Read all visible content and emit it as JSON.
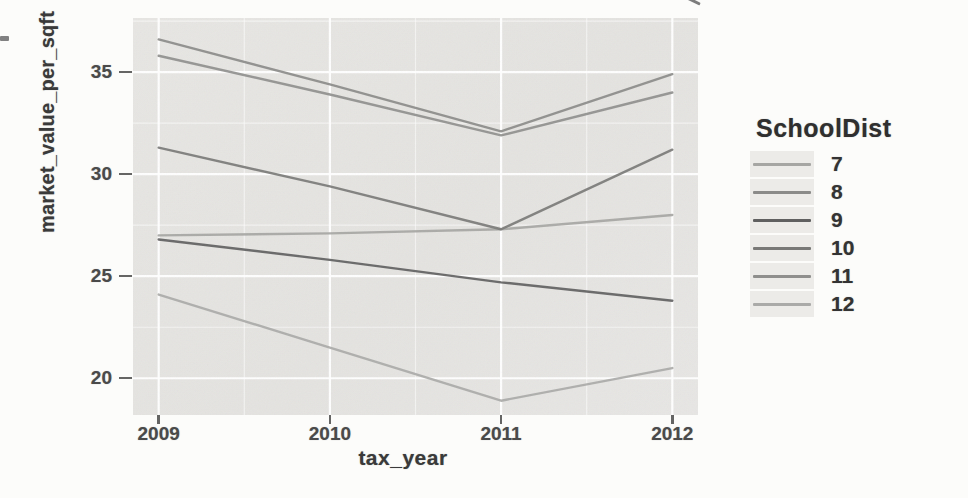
{
  "figure": {
    "y_axis_title": "market_value_per_sqft",
    "x_axis_title": "tax_year",
    "y_tick_labels": [
      "35",
      "30",
      "25",
      "20"
    ],
    "x_tick_labels": [
      "2009",
      "2010",
      "2011",
      "2012"
    ]
  },
  "legend": {
    "title": "SchoolDist",
    "entries": [
      {
        "label": "7"
      },
      {
        "label": "8"
      },
      {
        "label": "9"
      },
      {
        "label": "10"
      },
      {
        "label": "11"
      },
      {
        "label": "12"
      }
    ]
  },
  "chart_data": {
    "type": "line",
    "title": "",
    "xlabel": "tax_year",
    "ylabel": "market_value_per_sqft",
    "x": [
      2009,
      2010,
      2011,
      2012
    ],
    "series": [
      {
        "name": "7",
        "values": [
          27.0,
          27.1,
          27.3,
          28.0
        ],
        "color": "#a6a6a3"
      },
      {
        "name": "8",
        "values": [
          36.6,
          34.4,
          32.1,
          34.9
        ],
        "color": "#8b8b89"
      },
      {
        "name": "9",
        "values": [
          26.8,
          25.8,
          24.7,
          23.8
        ],
        "color": "#606060"
      },
      {
        "name": "10",
        "values": [
          31.3,
          29.4,
          27.3,
          31.2
        ],
        "color": "#797977"
      },
      {
        "name": "11",
        "values": [
          35.8,
          33.9,
          31.9,
          34.0
        ],
        "color": "#8f8f8d"
      },
      {
        "name": "12",
        "values": [
          24.1,
          21.5,
          18.9,
          20.5
        ],
        "color": "#aaaaa8"
      }
    ],
    "xlim": [
      2008.85,
      2012.15
    ],
    "ylim": [
      18.2,
      37.65
    ],
    "x_major_ticks": [
      2009,
      2010,
      2011,
      2012
    ],
    "x_minor_gridlines": [
      2009.5,
      2010.5,
      2011.5
    ],
    "y_major_ticks": [
      35,
      30,
      25,
      20
    ],
    "y_minor_gridlines": [
      37.5,
      32.5,
      27.5,
      22.5
    ],
    "grid": "white major and minor gridlines on gray panel",
    "legend_position": "right",
    "panel_bg": "#e5e4e1",
    "grid_color": "#ffffff",
    "text_color": "#3d3d3d"
  }
}
